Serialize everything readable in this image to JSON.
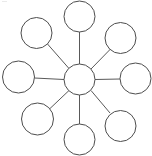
{
  "document": {
    "title": "Radial hub and spoke diagram",
    "background_color": "#ffffff",
    "line_color": "#595959",
    "circle_stroke_color": "#4d4d4d",
    "circle_fill_color": "#ffffff",
    "width": 152,
    "height": 156
  },
  "diagram": {
    "type": "hub-and-spoke",
    "node_label": "",
    "hub": {
      "name": "center-node",
      "label": "",
      "cx": 79.5,
      "cy": 79.5,
      "r": 15.5
    },
    "satellites": [
      {
        "name": "node-top",
        "label": "",
        "cx": 79.5,
        "cy": 16.5,
        "r": 15.5,
        "angle": 270
      },
      {
        "name": "node-top-left",
        "label": "",
        "cx": 36.5,
        "cy": 33.0,
        "r": 15.5,
        "angle": 201
      },
      {
        "name": "node-top-right",
        "label": "",
        "cx": 120.5,
        "cy": 38.0,
        "r": 15.5,
        "angle": 321
      },
      {
        "name": "node-left",
        "label": "",
        "cx": 18.5,
        "cy": 77.0,
        "r": 16.0,
        "angle": 180
      },
      {
        "name": "node-right",
        "label": "",
        "cx": 135.5,
        "cy": 78.5,
        "r": 15.5,
        "angle": 0
      },
      {
        "name": "node-bottom-left",
        "label": "",
        "cx": 37.5,
        "cy": 119.0,
        "r": 16.0,
        "angle": 155
      },
      {
        "name": "node-bottom",
        "label": "",
        "cx": 79.5,
        "cy": 139.5,
        "r": 15.5,
        "angle": 90
      },
      {
        "name": "node-bottom-right",
        "label": "",
        "cx": 120.5,
        "cy": 126.0,
        "r": 15.5,
        "angle": 38
      }
    ],
    "connectors": [
      {
        "name": "spoke-top",
        "x1": 79.5,
        "y1": 64.0,
        "x2": 79.5,
        "y2": 32.0
      },
      {
        "name": "spoke-top-left",
        "x1": 69.0,
        "y1": 68.5,
        "x2": 47.5,
        "y2": 44.0
      },
      {
        "name": "spoke-top-right",
        "x1": 91.0,
        "y1": 69.0,
        "x2": 110.5,
        "y2": 49.0
      },
      {
        "name": "spoke-left",
        "x1": 64.0,
        "y1": 79.5,
        "x2": 34.5,
        "y2": 78.0
      },
      {
        "name": "spoke-right",
        "x1": 95.0,
        "y1": 79.5,
        "x2": 120.0,
        "y2": 79.0
      },
      {
        "name": "spoke-bottom-left",
        "x1": 69.0,
        "y1": 90.5,
        "x2": 50.0,
        "y2": 108.5
      },
      {
        "name": "spoke-bottom",
        "x1": 79.5,
        "y1": 95.0,
        "x2": 79.5,
        "y2": 124.0
      },
      {
        "name": "spoke-bottom-right",
        "x1": 91.0,
        "y1": 90.5,
        "x2": 110.0,
        "y2": 113.0
      }
    ]
  }
}
